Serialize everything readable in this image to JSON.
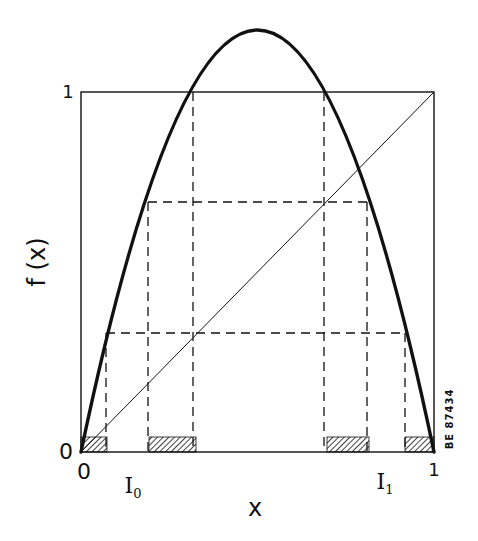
{
  "figure": {
    "y_axis_label": "f (x)",
    "x_axis_label": "x",
    "y_tick_top": "1",
    "y_tick_bottom": "0",
    "x_tick_left": "0",
    "x_tick_right": "1",
    "interval_0_label": "I",
    "interval_0_sub": "0",
    "interval_1_label": "I",
    "interval_1_sub": "1",
    "figure_code": "BE 87434"
  },
  "geometry": {
    "box": {
      "left": 81,
      "right": 434,
      "bottom": 452,
      "top": 92
    },
    "map_parameter_mu": 4.69,
    "peak_value": 1.17,
    "dashed_levels_fx": [
      1.0,
      0.695,
      0.33
    ],
    "hatched_intervals_x": [
      [
        0.0,
        0.074
      ],
      [
        0.193,
        0.326
      ],
      [
        0.697,
        0.816
      ],
      [
        0.918,
        1.0
      ]
    ],
    "curve_color": "#111111",
    "line_color": "#111111"
  }
}
